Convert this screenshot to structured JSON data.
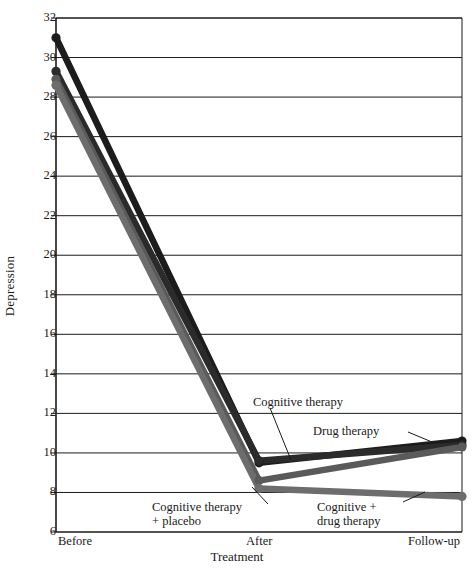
{
  "chart_data": {
    "type": "line",
    "title": "",
    "subtitle": "",
    "xlabel": "Treatment",
    "ylabel": "Depression",
    "categories": [
      "Before",
      "After",
      "Follow-up"
    ],
    "x": [
      0,
      1,
      2
    ],
    "ylim": [
      6,
      32
    ],
    "yticks": [
      6,
      8,
      10,
      12,
      14,
      16,
      18,
      20,
      22,
      24,
      26,
      28,
      30,
      32
    ],
    "ytick_labels": [
      "6",
      "8",
      "10",
      "12",
      "14",
      "16",
      "18",
      "20",
      "22",
      "24",
      "26",
      "28",
      "30",
      "32"
    ],
    "grid": "horizontal",
    "legend_position": "inline-annotations",
    "markers": "filled-circle",
    "series": [
      {
        "name": "Drug therapy",
        "color": "#1c1c1c",
        "values": [
          31.0,
          9.5,
          10.6
        ]
      },
      {
        "name": "Cognitive therapy",
        "color": "#2b2b2b",
        "values": [
          29.3,
          9.6,
          10.4
        ]
      },
      {
        "name": "Cognitive therapy + placebo",
        "color": "#5a5a5a",
        "values": [
          28.9,
          8.6,
          10.3
        ]
      },
      {
        "name": "Cognitive + drug therapy",
        "color": "#6d6d6d",
        "values": [
          28.6,
          8.2,
          7.8
        ]
      }
    ],
    "annotations": [
      {
        "id": "cognitive-therapy",
        "text": "Cognitive therapy",
        "lines": [
          "Cognitive therapy"
        ],
        "label_x": 253,
        "label_y": 395,
        "leader_from": [
          270,
          408
        ],
        "leader_to": [
          291,
          460
        ]
      },
      {
        "id": "drug-therapy",
        "text": "Drug therapy",
        "lines": [
          "Drug therapy"
        ],
        "label_x": 313,
        "label_y": 424,
        "leader_from": [
          408,
          432
        ],
        "leader_to": [
          432,
          442
        ]
      },
      {
        "id": "cognitive-therapy-placebo",
        "text": "Cognitive therapy + placebo",
        "lines": [
          "Cognitive therapy",
          "+ placebo"
        ],
        "label_x": 152,
        "label_y": 500,
        "leader_from": [
          268,
          504
        ],
        "leader_to": [
          252,
          487
        ]
      },
      {
        "id": "cognitive-drug-therapy",
        "text": "Cognitive + drug therapy",
        "lines": [
          "Cognitive +",
          "drug therapy"
        ],
        "label_x": 317,
        "label_y": 500,
        "leader_from": [
          403,
          502
        ],
        "leader_to": [
          425,
          492
        ]
      }
    ]
  }
}
